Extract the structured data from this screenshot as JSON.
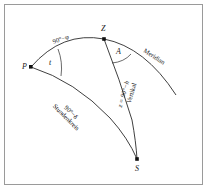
{
  "figure": {
    "type": "spherical-astronomical-triangle",
    "background_color": "#ffffff",
    "line_color": "#2a2a2a",
    "frame_color": "#9a9a9a"
  },
  "points": [
    {
      "id": "P",
      "label": "P",
      "x": 31,
      "y": 67,
      "marker": "square",
      "label_dx": -8,
      "label_dy": -1
    },
    {
      "id": "Z",
      "label": "Z",
      "x": 104,
      "y": 39,
      "marker": "square",
      "label_dx": -2,
      "label_dy": -10
    },
    {
      "id": "S",
      "label": "S",
      "x": 137,
      "y": 159,
      "marker": "square",
      "label_dx": -2,
      "label_dy": 10
    }
  ],
  "angles": [
    {
      "id": "t",
      "label": "t",
      "at": "P",
      "x": 50,
      "y": 63
    },
    {
      "id": "A",
      "label": "A",
      "x": 116,
      "y": 52
    }
  ],
  "arc_labels": {
    "polar_distance": "90°−φ",
    "hour_circle_value": "90°−δ",
    "hour_circle_name": "Stundenkreis",
    "zenith_distance": "z = 90°−h",
    "vertical_name": "Vertikal",
    "meridian_name": "Meridian"
  },
  "label_positions": {
    "polar_distance": {
      "x": 53,
      "y": 39,
      "rotate": -19
    },
    "hour_circle": {
      "x": 60,
      "y": 98,
      "rotate": 45
    },
    "zenith_distance": {
      "x": 122,
      "y": 95,
      "rotate": -74
    },
    "vertical_name": {
      "x": 131,
      "y": 93,
      "rotate": -74
    },
    "meridian_name": {
      "x": 146,
      "y": 44,
      "rotate": 33
    }
  }
}
